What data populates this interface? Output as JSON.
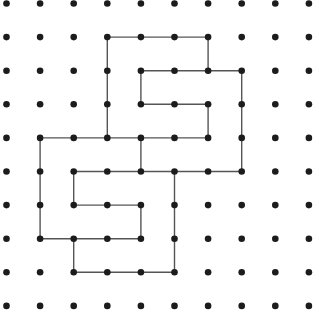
{
  "diagram": {
    "type": "dot-grid-path",
    "grid": {
      "columns": 10,
      "rows": 10,
      "origin_x": 6.5,
      "origin_y": 3.5,
      "spacing": 33.6,
      "dot_radius": 3.3,
      "dot_color": "#1c1c1c"
    },
    "line": {
      "color": "#555555",
      "width": 1.4
    },
    "polylines": [
      [
        [
          3,
          4
        ],
        [
          3,
          1
        ],
        [
          6,
          1
        ],
        [
          6,
          2
        ],
        [
          7,
          2
        ],
        [
          7,
          5
        ],
        [
          2,
          5
        ],
        [
          2,
          6
        ],
        [
          4,
          6
        ],
        [
          4,
          7
        ],
        [
          1,
          7
        ],
        [
          1,
          4
        ],
        [
          6,
          4
        ],
        [
          6,
          3
        ],
        [
          4,
          3
        ],
        [
          4,
          2
        ],
        [
          6,
          2
        ]
      ],
      [
        [
          4,
          4
        ],
        [
          4,
          5
        ]
      ],
      [
        [
          2,
          7
        ],
        [
          2,
          8
        ],
        [
          5,
          8
        ],
        [
          5,
          5
        ]
      ]
    ]
  }
}
